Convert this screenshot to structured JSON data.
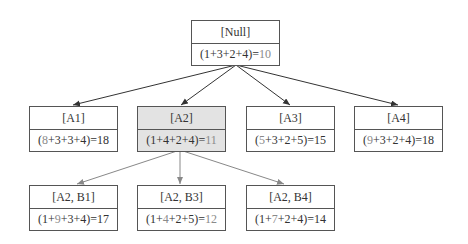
{
  "diagram": {
    "colors": {
      "border": "#555555",
      "selected_fill": "#e3e3e3",
      "highlight_text": "#8a8a8a",
      "edge_dark": "#333333",
      "edge_light": "#888888"
    },
    "root": {
      "label": "[Null]",
      "calc_parts": [
        "(1+3+2+4)=",
        "10"
      ],
      "calc_highlight": [
        false,
        true
      ]
    },
    "level1": [
      {
        "label": "[A1]",
        "calc_parts": [
          "(",
          "8",
          "+3+3+4)=18"
        ],
        "selected": false
      },
      {
        "label": "[A2]",
        "calc_parts": [
          "(1+4+2+4)=",
          "11"
        ],
        "selected": true
      },
      {
        "label": "[A3]",
        "calc_parts": [
          "(",
          "5",
          "+3+2+5)=15"
        ],
        "selected": false
      },
      {
        "label": "[A4]",
        "calc_parts": [
          "(",
          "9",
          "+3+2+4)=18"
        ],
        "selected": false
      }
    ],
    "level2": [
      {
        "label": "[A2, B1]",
        "calc_parts": [
          "(1+",
          "9",
          "+3+4)=17"
        ]
      },
      {
        "label": "[A2, B3]",
        "calc_parts": [
          "(1+",
          "4",
          "+2+5)=",
          "12"
        ]
      },
      {
        "label": "[A2, B4]",
        "calc_parts": [
          "(1+",
          "7",
          "+2+4)=14"
        ]
      }
    ]
  }
}
